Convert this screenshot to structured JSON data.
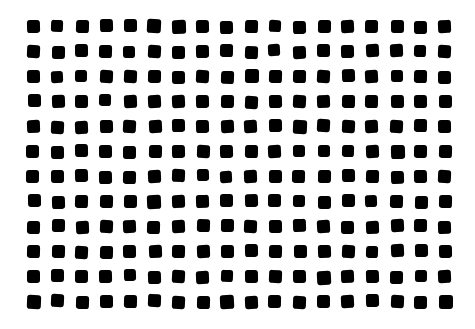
{
  "pattern": {
    "type": "dot-grid",
    "rows": 12,
    "cols": 18,
    "shape": "rounded-square",
    "fill_color": "#000000",
    "background_color": "#ffffff",
    "origin_x": 27,
    "origin_y": 20,
    "step_x": 24.2,
    "step_y": 25.0,
    "size": 13
  }
}
